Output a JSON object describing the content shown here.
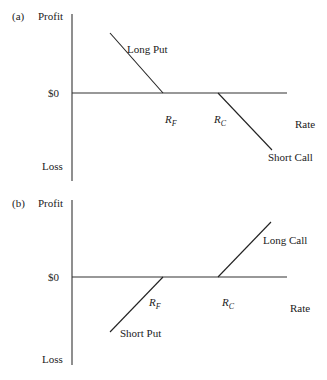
{
  "figure": {
    "panels": [
      {
        "id": "a",
        "tag": "(a)",
        "y_top_label": "Profit",
        "y_bottom_label": "Loss",
        "zero_label": "$0",
        "x_label": "Rate",
        "rf": {
          "main": "R",
          "sub": "F"
        },
        "rc": {
          "main": "R",
          "sub": "C"
        },
        "lines": [
          {
            "name": "Long Put",
            "label": "Long Put"
          },
          {
            "name": "Short Call",
            "label": "Short Call"
          }
        ]
      },
      {
        "id": "b",
        "tag": "(b)",
        "y_top_label": "Profit",
        "y_bottom_label": "Loss",
        "zero_label": "$0",
        "x_label": "Rate",
        "rf": {
          "main": "R",
          "sub": "F"
        },
        "rc": {
          "main": "R",
          "sub": "C"
        },
        "lines": [
          {
            "name": "Long Call",
            "label": "Long Call"
          },
          {
            "name": "Short Put",
            "label": "Short Put"
          }
        ]
      }
    ]
  }
}
